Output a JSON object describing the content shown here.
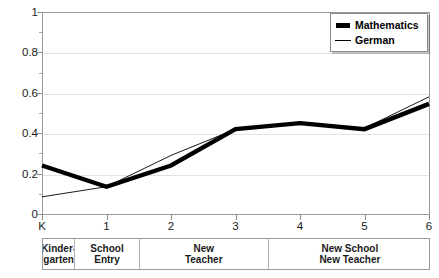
{
  "chart_data": {
    "type": "line",
    "title": "",
    "xlabel": "",
    "ylabel": "",
    "ylim": [
      0,
      1
    ],
    "yticks": [
      0,
      0.2,
      0.4,
      0.6,
      0.8,
      1
    ],
    "ytick_labels": [
      "0",
      "0.2",
      "0.4",
      "0.6",
      "0.8",
      "1"
    ],
    "grid": true,
    "x": [
      "K",
      "1",
      "2",
      "3",
      "4",
      "5",
      "6"
    ],
    "xtick_labels": [
      "K",
      "1",
      "2",
      "3",
      "4",
      "5",
      "6"
    ],
    "legend_position": "top-right",
    "series": [
      {
        "name": "Mathematics",
        "style": "thick",
        "color": "#000000",
        "values": [
          0.24,
          0.135,
          0.24,
          0.42,
          0.45,
          0.42,
          0.545
        ]
      },
      {
        "name": "German",
        "style": "thin",
        "color": "#000000",
        "values": [
          0.085,
          0.135,
          0.29,
          0.42,
          0.455,
          0.425,
          0.58
        ]
      }
    ],
    "category_bands": [
      {
        "label_lines": [
          "Kinder-",
          "garten"
        ],
        "span_start": "K",
        "span_end": "K"
      },
      {
        "label_lines": [
          "School",
          "Entry"
        ],
        "span_start": "1",
        "span_end": "1"
      },
      {
        "label_lines": [
          "New",
          "Teacher"
        ],
        "span_start": "2",
        "span_end": "3"
      },
      {
        "label_lines": [
          "New School",
          "New Teacher"
        ],
        "span_start": "4",
        "span_end": "6"
      }
    ]
  },
  "legend": {
    "items": [
      {
        "label": "Mathematics",
        "swatch": "thick-bar-marker",
        "bold": true
      },
      {
        "label": "German",
        "swatch": "thin-line-marker",
        "bold": true
      }
    ]
  },
  "colors": {
    "series": "#000000",
    "frame": "#9a9a9a",
    "gridline": "#e2e2e2",
    "text": "#1a1a1a",
    "background": "#ffffff"
  }
}
